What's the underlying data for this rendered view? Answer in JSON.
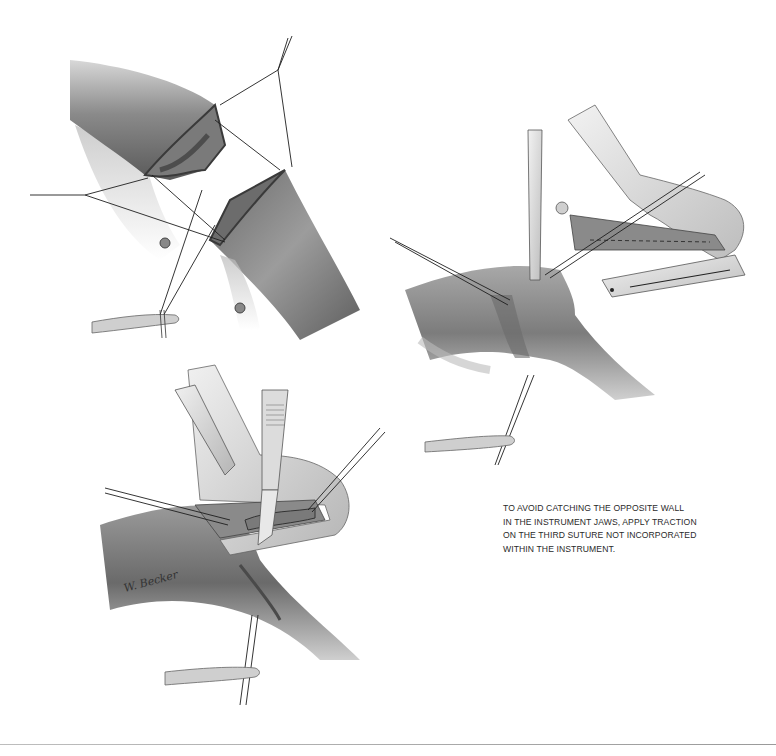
{
  "plate": {
    "background": "#ffffff",
    "ink_color": "#2a2a2a",
    "rule_color": "#a8a8a8"
  },
  "panels": [
    {
      "id": "panel-1",
      "label": "Two bowel ends with stay sutures before approximation",
      "position": "top-left"
    },
    {
      "id": "panel-2",
      "label": "Instrument jaws placed around approximated bowel with forceps traction",
      "position": "right"
    },
    {
      "id": "panel-3",
      "label": "Scalpel excising tissue protruding from closed instrument",
      "position": "bottom-left"
    }
  ],
  "caption": {
    "lines": [
      "TO AVOID CATCHING THE OPPOSITE WALL",
      "IN THE INSTRUMENT JAWS, APPLY TRACTION",
      "ON THE THIRD SUTURE NOT INCORPORATED",
      "WITHIN THE INSTRUMENT."
    ]
  },
  "signature": {
    "text": "W. Becker"
  }
}
